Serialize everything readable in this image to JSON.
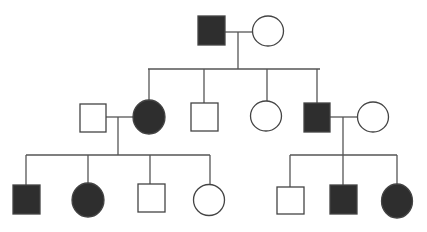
{
  "diagram": {
    "type": "pedigree",
    "colors": {
      "affected": "#2e2e2e",
      "unaffected": "#ffffff",
      "line": "#555555"
    },
    "generations": [
      {
        "id": "I",
        "individuals": [
          {
            "id": "I-1",
            "sex": "male",
            "affected": true
          },
          {
            "id": "I-2",
            "sex": "female",
            "affected": false
          }
        ]
      },
      {
        "id": "II",
        "individuals": [
          {
            "id": "II-spouse-1",
            "sex": "male",
            "affected": false
          },
          {
            "id": "II-1",
            "sex": "female",
            "affected": true
          },
          {
            "id": "II-2",
            "sex": "male",
            "affected": false
          },
          {
            "id": "II-3",
            "sex": "female",
            "affected": false
          },
          {
            "id": "II-4",
            "sex": "male",
            "affected": true
          },
          {
            "id": "II-spouse-2",
            "sex": "female",
            "affected": false
          }
        ]
      },
      {
        "id": "III",
        "individuals": [
          {
            "id": "III-1",
            "sex": "male",
            "affected": true
          },
          {
            "id": "III-2",
            "sex": "female",
            "affected": true
          },
          {
            "id": "III-3",
            "sex": "male",
            "affected": false
          },
          {
            "id": "III-4",
            "sex": "female",
            "affected": false
          },
          {
            "id": "III-5",
            "sex": "male",
            "affected": false
          },
          {
            "id": "III-6",
            "sex": "male",
            "affected": true
          },
          {
            "id": "III-7",
            "sex": "female",
            "affected": true
          }
        ]
      }
    ]
  }
}
